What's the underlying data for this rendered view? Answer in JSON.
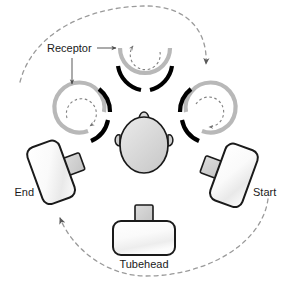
{
  "diagram": {
    "labels": {
      "receptor": "Receptor",
      "start": "Start",
      "end": "End",
      "tubehead": "Tubehead"
    },
    "colors": {
      "outline": "#1a1a1a",
      "receptor_gray_arc": "#b3b3b3",
      "receptor_black_arc": "#000000",
      "dashed_path": "#999999",
      "device_fill_light": "#fbfbfb",
      "device_fill_shade": "#e4e4e4",
      "tab_fill": "#cfcfcf",
      "head_fill": "#d4d4d4",
      "label_text": "#1a1a1a"
    },
    "components": {
      "head": {
        "name": "patient-head",
        "description": "Oval head seen from above with ears and nose"
      },
      "receptors": [
        {
          "position": "left",
          "name": "receptor-left",
          "rotation_direction": "clockwise"
        },
        {
          "position": "top",
          "name": "receptor-top",
          "rotation_direction": "counterclockwise"
        },
        {
          "position": "right",
          "name": "receptor-right",
          "rotation_direction": "clockwise"
        }
      ],
      "devices": [
        {
          "position": "right",
          "name": "device-start",
          "label": "Start"
        },
        {
          "position": "left",
          "name": "device-end",
          "label": "End"
        },
        {
          "position": "bottom",
          "name": "device-tubehead",
          "label": "Tubehead"
        }
      ],
      "paths": [
        {
          "name": "receptor-travel-arc",
          "style": "dashed",
          "arrow": "down-right",
          "description": "Dashed arc over the top from upper-left to right"
        },
        {
          "name": "tubehead-travel-arc",
          "style": "dashed",
          "arrow": "up-left",
          "description": "Dashed arc under the bottom from right to End device"
        }
      ],
      "annotations": [
        {
          "name": "receptor-pointer-right",
          "from": "Receptor",
          "to": "receptor-top"
        },
        {
          "name": "receptor-pointer-down",
          "from": "Receptor",
          "to": "receptor-left"
        }
      ]
    }
  }
}
